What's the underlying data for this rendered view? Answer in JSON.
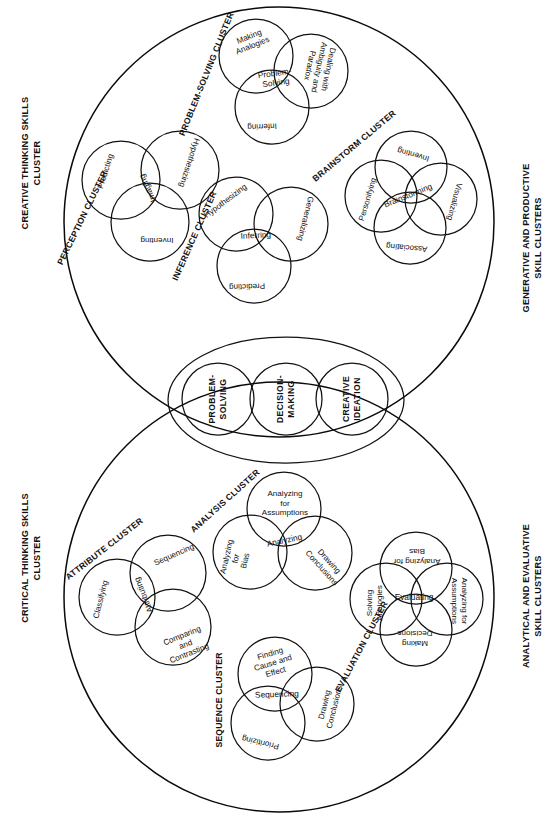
{
  "diagram": {
    "side_labels": {
      "top_left": [
        "CREATIVE THINKING SKILLS",
        "CLUSTER"
      ],
      "bottom_left": [
        "CRITICAL THINKING SKILLS",
        "CLUSTER"
      ],
      "top_right": [
        "GENERATIVE AND PRODUCTIVE",
        "SKILL CLUSTERS"
      ],
      "bottom_right": [
        "ANALYTICAL AND EVALUATIVE",
        "SKILL CLUSTERS"
      ]
    },
    "core_circles": [
      {
        "lines": [
          "PROBLEM-",
          "SOLVING"
        ]
      },
      {
        "lines": [
          "DECISION-",
          "MAKING"
        ]
      },
      {
        "lines": [
          "CREATIVE",
          "IDEATION"
        ]
      }
    ],
    "clusters": [
      {
        "id": "perception",
        "label": "PERCEPTION CLUSTER",
        "center": "Imaging",
        "petals": [
          "Predicting",
          "Hypothesizing",
          "Inventing"
        ]
      },
      {
        "id": "problem-solving",
        "label": "PROBLEM-SOLVING CLUSTER",
        "center": [
          "Problem-",
          "Solving"
        ],
        "petals": [
          [
            "Making",
            "Analogies"
          ],
          [
            "Dealing with",
            "Ambiguity and",
            "Paradox"
          ],
          "Inferring"
        ]
      },
      {
        "id": "inference",
        "label": "INFERENCE CLUSTER",
        "center": "Inferring",
        "petals": [
          "Hypothesizing",
          "Generalizing",
          "Predicting"
        ]
      },
      {
        "id": "brainstorm",
        "label": "BRAINSTORM CLUSTER",
        "center": "Brainstorming",
        "petals": [
          "Personifying",
          "Inventing",
          "Visualizing",
          "Associating"
        ]
      },
      {
        "id": "attribute",
        "label": "ATTRIBUTE CLUSTER",
        "center": "Attributing",
        "petals": [
          "Classifying",
          "Sequencing",
          [
            "Comparing",
            "and",
            "Contrasting"
          ]
        ]
      },
      {
        "id": "analysis",
        "label": "ANALYSIS CLUSTER",
        "center": "Analyzing",
        "petals": [
          [
            "Analyzing",
            "for",
            "Assumptions"
          ],
          [
            "Analyzing",
            "for",
            "Bias"
          ],
          [
            "Drawing",
            "Conclusions"
          ]
        ]
      },
      {
        "id": "sequence",
        "label": "SEQUENCE CLUSTER",
        "center": "Sequencing",
        "petals": [
          [
            "Finding",
            "Cause and",
            "Effect"
          ],
          [
            "Drawing",
            "Conclusions"
          ],
          "Prioritizing"
        ]
      },
      {
        "id": "evaluation",
        "label": "EVALUATION CLUSTER",
        "center": "Evaluating",
        "petals": [
          [
            "Solving",
            "Analogies"
          ],
          [
            "Analyzing for",
            "Bias"
          ],
          [
            "Analyzing for",
            "Assumptions"
          ],
          [
            "Making",
            "Decisions"
          ]
        ]
      }
    ],
    "colors": {
      "ink": "#111111",
      "background": "#ffffff"
    }
  }
}
